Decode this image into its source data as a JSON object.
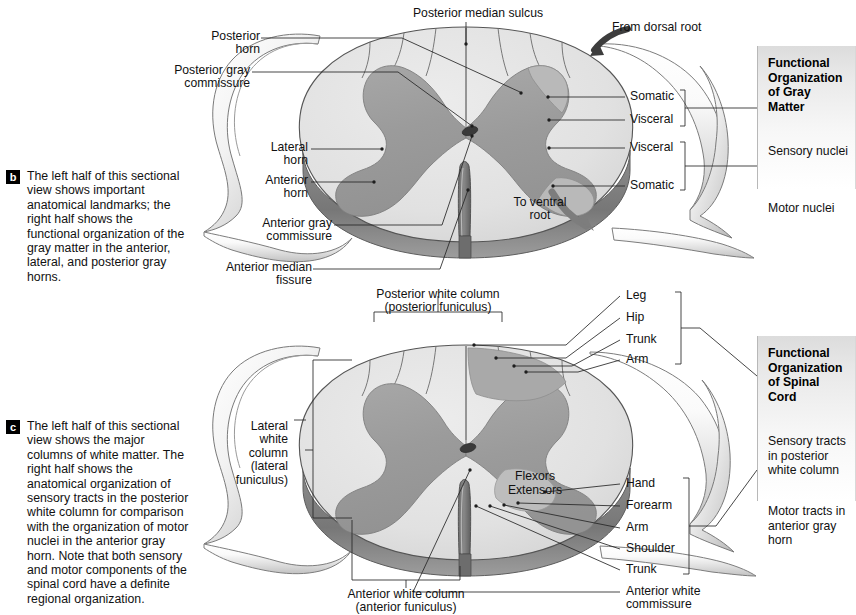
{
  "figure": {
    "colors": {
      "white_matter": "#e2e2e2",
      "gray_matter": "#9d9d9d",
      "gray_matter_light": "#b5b5b5",
      "outline": "#4a4a4a",
      "rim_dark": "#7b7b7b",
      "leader": "#2a2a2a",
      "marker_bg": "#000000",
      "marker_fg": "#ffffff",
      "box_top": "#dcdcdc",
      "box_bottom": "#ffffff"
    }
  },
  "panel_b": {
    "marker": "b",
    "caption": "The left half of this sectional view shows important anatomical landmarks; the right half shows the functional organization of the gray matter in the anterior, lateral, and posterior gray horns.",
    "labels_left": [
      {
        "id": "posterior-horn",
        "text": "Posterior\nhorn"
      },
      {
        "id": "posterior-gray-commissure",
        "text": "Posterior gray\ncommissure"
      },
      {
        "id": "lateral-horn",
        "text": "Lateral\nhorn"
      },
      {
        "id": "anterior-horn",
        "text": "Anterior\nhorn"
      },
      {
        "id": "anterior-gray-commissure",
        "text": "Anterior gray\ncommissure"
      },
      {
        "id": "anterior-median-fissure",
        "text": "Anterior median\nfissure"
      }
    ],
    "labels_top": [
      {
        "id": "posterior-median-sulcus",
        "text": "Posterior median sulcus"
      },
      {
        "id": "from-dorsal-root",
        "text": "From dorsal root"
      }
    ],
    "labels_inner": [
      {
        "id": "to-ventral-root",
        "text": "To ventral\nroot"
      }
    ],
    "labels_right": [
      {
        "id": "somatic-sensory",
        "text": "Somatic"
      },
      {
        "id": "visceral-sensory",
        "text": "Visceral"
      },
      {
        "id": "visceral-motor",
        "text": "Visceral"
      },
      {
        "id": "somatic-motor",
        "text": "Somatic"
      }
    ],
    "infobox": {
      "title": "Functional\nOrganization\nof Gray Matter",
      "line1": "Sensory nuclei",
      "line2": "Motor nuclei"
    }
  },
  "panel_c": {
    "marker": "c",
    "caption": "The left half of this sectional view shows the major columns of white matter. The right half shows the anatomical organization of sensory tracts in the posterior white column for comparison with the organization of motor nuclei in the anterior gray horn. Note that both sensory and motor components of the spinal cord have a definite regional organization.",
    "labels_left": [
      {
        "id": "lateral-white-column",
        "text": "Lateral\nwhite\ncolumn\n(lateral\nfuniculus)"
      }
    ],
    "labels_top": [
      {
        "id": "posterior-white-column",
        "text": "Posterior white column\n(posterior funiculus)"
      }
    ],
    "labels_bottom": [
      {
        "id": "anterior-white-column",
        "text": "Anterior white column\n(anterior funiculus)"
      },
      {
        "id": "anterior-white-commissure",
        "text": "Anterior white\ncommissure"
      }
    ],
    "labels_inner": [
      {
        "id": "flexors",
        "text": "Flexors"
      },
      {
        "id": "extensors",
        "text": "Extensors"
      }
    ],
    "sensory_tracts": [
      {
        "id": "leg",
        "text": "Leg"
      },
      {
        "id": "hip",
        "text": "Hip"
      },
      {
        "id": "trunk",
        "text": "Trunk"
      },
      {
        "id": "arm",
        "text": "Arm"
      }
    ],
    "motor_nuclei": [
      {
        "id": "hand",
        "text": "Hand"
      },
      {
        "id": "forearm",
        "text": "Forearm"
      },
      {
        "id": "arm",
        "text": "Arm"
      },
      {
        "id": "shoulder",
        "text": "Shoulder"
      },
      {
        "id": "trunk",
        "text": "Trunk"
      }
    ],
    "infobox": {
      "title": "Functional\nOrganization\nof Spinal Cord",
      "line1": "Sensory tracts\nin posterior\nwhite column",
      "line2": "Motor tracts in\nanterior gray\nhorn"
    }
  }
}
